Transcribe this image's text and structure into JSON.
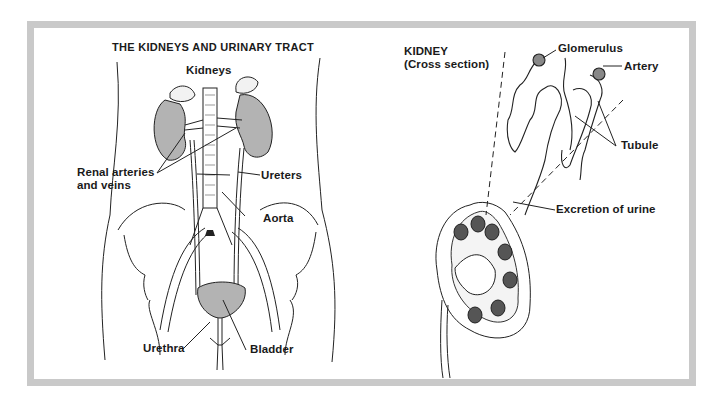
{
  "left_panel": {
    "title": "THE KIDNEYS AND URINARY TRACT",
    "labels": {
      "kidneys": "Kidneys",
      "renal_line1": "Renal arteries",
      "renal_line2": "and veins",
      "ureters": "Ureters",
      "aorta": "Aorta",
      "urethra": "Urethra",
      "bladder": "Bladder"
    }
  },
  "right_panel": {
    "title_line1": "KIDNEY",
    "title_line2": "(Cross section)",
    "labels": {
      "glomerulus": "Glomerulus",
      "artery": "Artery",
      "tubule": "Tubule",
      "excretion": "Excretion of urine"
    }
  },
  "colors": {
    "frame": "#c9c9c9",
    "organ_fill": "#b3b3b3",
    "ink": "#1a1a1a"
  }
}
